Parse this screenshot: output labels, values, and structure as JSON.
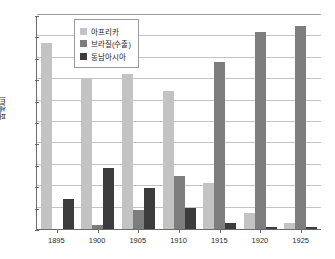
{
  "chart_data": {
    "type": "bar",
    "title": "",
    "xlabel": "",
    "ylabel": "퍼센트",
    "ylim": [
      0,
      100
    ],
    "ytick_step": 10,
    "yticks": [
      100,
      90,
      80,
      70,
      60,
      50,
      40,
      30,
      20,
      10,
      0
    ],
    "grid": true,
    "legend_position": "top-left-inside",
    "categories": [
      "1895",
      "1900",
      "1905",
      "1910",
      "1915",
      "1920",
      "1925"
    ],
    "series": [
      {
        "name": "아프리카",
        "color": "#c3c3c3",
        "values": [
          87,
          70,
          72.5,
          64.5,
          21.5,
          7.5,
          3
        ]
      },
      {
        "name": "브라질(수출)",
        "color": "#7d7d7d",
        "values": [
          0,
          2,
          9,
          25,
          78,
          92,
          95
        ]
      },
      {
        "name": "동남아시아",
        "color": "#3c3c3c",
        "values": [
          14,
          28.5,
          19,
          10,
          3,
          1,
          1
        ]
      }
    ]
  },
  "axis": {
    "y_axis_title": "퍼센트"
  }
}
